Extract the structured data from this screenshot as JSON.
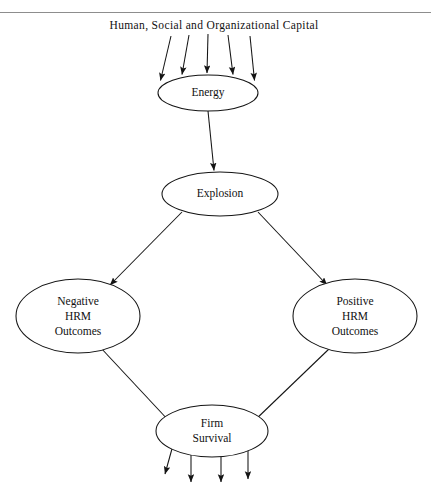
{
  "figure": {
    "top_rule": true,
    "caption": "Human, Social and Organizational Capital",
    "nodes": [
      {
        "id": "energy",
        "label_lines": [
          "Energy"
        ],
        "cx": 208,
        "cy": 93,
        "rx": 50,
        "ry": 18
      },
      {
        "id": "explosion",
        "label_lines": [
          "Explosion"
        ],
        "cx": 220,
        "cy": 194,
        "rx": 58,
        "ry": 22
      },
      {
        "id": "negative",
        "label_lines": [
          "Negative",
          "HRM",
          "Outcomes"
        ],
        "cx": 78,
        "cy": 316,
        "rx": 62,
        "ry": 37
      },
      {
        "id": "positive",
        "label_lines": [
          "Positive",
          "HRM",
          "Outcomes"
        ],
        "cx": 355,
        "cy": 316,
        "rx": 62,
        "ry": 37
      },
      {
        "id": "firm",
        "label_lines": [
          "Firm",
          "Survival"
        ],
        "cx": 212,
        "cy": 431,
        "rx": 56,
        "ry": 26
      }
    ],
    "inflow_arrow_count": 5,
    "outflow_arrow_count": 4,
    "edges": [
      {
        "from": "energy",
        "to": "explosion",
        "arrowhead": true
      },
      {
        "from": "explosion",
        "to": "negative",
        "arrowhead": true
      },
      {
        "from": "explosion",
        "to": "positive",
        "arrowhead": true
      },
      {
        "from": "negative",
        "to": "firm",
        "arrowhead": false
      },
      {
        "from": "positive",
        "to": "firm",
        "arrowhead": false
      }
    ],
    "colors": {
      "stroke": "#141414",
      "background": "#ffffff",
      "rule": "#8d8d8d",
      "text": "#111111"
    }
  }
}
